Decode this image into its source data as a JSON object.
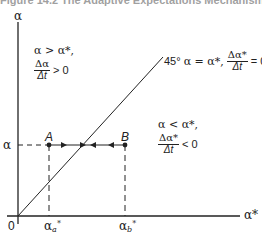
{
  "figure": {
    "caption_partial": "Figure 14.2   The Adaptive Expectations Mechanism",
    "y_axis_label": "α",
    "x_axis_label": "α*",
    "origin_label": "0",
    "y_tick_label": "α",
    "x_ticks": [
      {
        "base": "α",
        "sub": "a",
        "sup": "*"
      },
      {
        "base": "α",
        "sub": "b",
        "sup": "*"
      }
    ],
    "points": [
      {
        "label": "A"
      },
      {
        "label": "B"
      }
    ],
    "line_label": {
      "angle": "45°",
      "eq": "α = α*,",
      "num": "Δα*",
      "den": "Δt",
      "rhs": "= 0"
    },
    "region_upper": {
      "cond": "α > α*,",
      "num": "Δα",
      "den": "Δt",
      "rhs": "> 0"
    },
    "region_lower": {
      "cond": "α < α*,",
      "num": "Δα*",
      "den": "Δt",
      "rhs": "< 0"
    },
    "colors": {
      "line": "#222222",
      "background": "#ffffff"
    }
  }
}
